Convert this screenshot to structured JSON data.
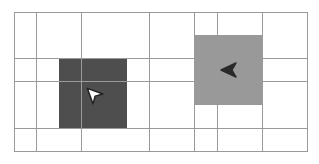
{
  "grid": {
    "cols": 13,
    "rows": 6,
    "cell_w": 22.6,
    "cell_h": 23.3,
    "line_color": "#9a9a9a",
    "bg_color": "#ffffff"
  },
  "regions": [
    {
      "name": "dark-square",
      "col": 2,
      "row": 2,
      "w": 3,
      "h": 3,
      "color": "#4e4e4e"
    },
    {
      "name": "light-square",
      "col": 8,
      "row": 1,
      "w": 3,
      "h": 3,
      "color": "#999999"
    }
  ],
  "agents": [
    {
      "name": "white-arrow-agent",
      "col": 3,
      "row": 3,
      "direction": "up-left",
      "fill": "#ffffff",
      "stroke": "#222222"
    },
    {
      "name": "dark-arrow-agent",
      "col": 9,
      "row": 2,
      "direction": "left",
      "fill": "#2a2a2a",
      "stroke": "#2a2a2a"
    }
  ]
}
